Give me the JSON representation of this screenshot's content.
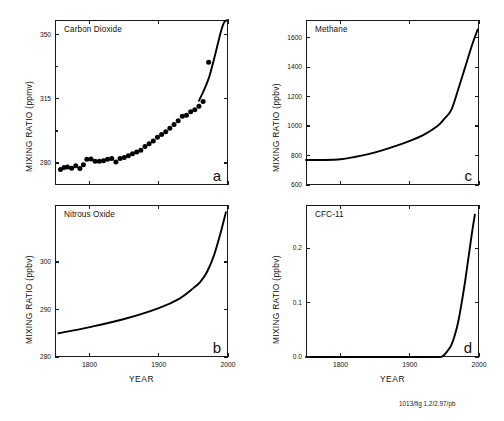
{
  "figure": {
    "credit": "1013/fig 1.2/2.97/pb",
    "xlabel": "YEAR"
  },
  "panels": [
    {
      "id": "a",
      "letter": "a",
      "title": "Carbon Dioxide",
      "ylabel": "MIXING RATIO (ppmv)",
      "ytick_labels": [
        "280",
        "315",
        "350"
      ],
      "xtick_labels": [
        "",
        "",
        ""
      ]
    },
    {
      "id": "c",
      "letter": "c",
      "title": "Methane",
      "ylabel": "MIXING RATIO (ppbv)",
      "ytick_labels": [
        "600",
        "800",
        "1000",
        "1200",
        "1400",
        "1600"
      ],
      "xtick_labels": [
        "",
        "",
        ""
      ]
    },
    {
      "id": "b",
      "letter": "b",
      "title": "Nitrous Oxide",
      "ylabel": "MIXING RATIO (ppbv)",
      "ytick_labels": [
        "280",
        "290",
        "300"
      ],
      "xtick_labels": [
        "1800",
        "1900",
        "2000"
      ]
    },
    {
      "id": "d",
      "letter": "d",
      "title": "CFC-11",
      "ylabel": "MIXING RATIO (ppbv)",
      "ytick_labels": [
        "0.0",
        "0.1",
        "0.2"
      ],
      "xtick_labels": [
        "1800",
        "1900",
        "2000"
      ]
    }
  ],
  "chart_data": [
    {
      "type": "scatter",
      "panel": "a",
      "title": "Carbon Dioxide",
      "xlabel": "YEAR",
      "ylabel": "MIXING RATIO (ppmv)",
      "units": "ppmv",
      "xlim": [
        1750,
        2000
      ],
      "ylim": [
        268,
        358
      ],
      "yticks": [
        280,
        315,
        350
      ],
      "xticks": [
        1800,
        1900,
        2000
      ],
      "grid": false,
      "legend": false,
      "series": [
        {
          "name": "CO2 ice-core measurements",
          "mode": "markers",
          "x": [
            1758,
            1763,
            1768,
            1774,
            1780,
            1786,
            1791,
            1796,
            1802,
            1808,
            1814,
            1820,
            1826,
            1832,
            1838,
            1844,
            1850,
            1856,
            1862,
            1868,
            1874,
            1880,
            1886,
            1892,
            1898,
            1904,
            1910,
            1916,
            1922,
            1928,
            1934,
            1940,
            1946,
            1952,
            1958,
            1964,
            1972
          ],
          "y": [
            276.5,
            277.5,
            277.8,
            277.2,
            278.5,
            277.0,
            279.0,
            282.0,
            282.2,
            281.0,
            281.0,
            281.2,
            282.0,
            282.5,
            280.5,
            282.5,
            283.0,
            284.0,
            285.0,
            286.0,
            287.0,
            289.0,
            290.5,
            292.0,
            294.0,
            295.5,
            297.0,
            299.0,
            301.0,
            303.0,
            305.5,
            306.0,
            308.0,
            309.0,
            311.0,
            313.5,
            335.0
          ]
        },
        {
          "name": "CO2 atmospheric record",
          "mode": "line",
          "x": [
            1958,
            1965,
            1972,
            1978,
            1984,
            1990,
            1995,
            2000
          ],
          "y": [
            314.0,
            319.5,
            326.0,
            334.0,
            343.0,
            352.0,
            357.0,
            358.0
          ]
        }
      ]
    },
    {
      "type": "line",
      "panel": "c",
      "title": "Methane",
      "xlabel": "YEAR",
      "ylabel": "MIXING RATIO (ppbv)",
      "units": "ppbv",
      "xlim": [
        1750,
        2000
      ],
      "ylim": [
        600,
        1720
      ],
      "yticks": [
        600,
        800,
        1000,
        1200,
        1400,
        1600
      ],
      "xticks": [
        1800,
        1900,
        2000
      ],
      "grid": false,
      "legend": false,
      "series": [
        {
          "name": "CH4",
          "mode": "line",
          "x": [
            1750,
            1775,
            1800,
            1820,
            1840,
            1860,
            1880,
            1900,
            1920,
            1940,
            1950,
            1960,
            1970,
            1980,
            1990,
            1998
          ],
          "y": [
            770,
            770,
            775,
            790,
            810,
            835,
            865,
            900,
            940,
            1000,
            1050,
            1110,
            1250,
            1400,
            1550,
            1655
          ]
        }
      ]
    },
    {
      "type": "line",
      "panel": "b",
      "title": "Nitrous Oxide",
      "xlabel": "YEAR",
      "ylabel": "MIXING RATIO (ppbv)",
      "units": "ppbv",
      "xlim": [
        1750,
        2000
      ],
      "ylim": [
        280,
        312
      ],
      "yticks": [
        280,
        290,
        300
      ],
      "xticks": [
        1800,
        1900,
        2000
      ],
      "grid": false,
      "legend": false,
      "series": [
        {
          "name": "N2O",
          "mode": "line",
          "x": [
            1755,
            1800,
            1850,
            1900,
            1930,
            1950,
            1960,
            1970,
            1980,
            1990,
            1997
          ],
          "y": [
            285.0,
            286.3,
            288.0,
            290.3,
            292.3,
            294.5,
            295.8,
            298.0,
            301.5,
            306.5,
            310.5
          ]
        }
      ]
    },
    {
      "type": "line",
      "panel": "d",
      "title": "CFC-11",
      "xlabel": "YEAR",
      "ylabel": "MIXING RATIO (ppbv)",
      "units": "ppbv",
      "xlim": [
        1750,
        2000
      ],
      "ylim": [
        0.0,
        0.28
      ],
      "yticks": [
        0.0,
        0.1,
        0.2
      ],
      "xticks": [
        1800,
        1900,
        2000
      ],
      "grid": false,
      "legend": false,
      "series": [
        {
          "name": "CFC-11",
          "mode": "line",
          "x": [
            1750,
            1900,
            1940,
            1948,
            1955,
            1960,
            1965,
            1970,
            1975,
            1980,
            1985,
            1990,
            1994
          ],
          "y": [
            0.0,
            0.0,
            0.0,
            0.002,
            0.012,
            0.022,
            0.04,
            0.065,
            0.1,
            0.14,
            0.185,
            0.23,
            0.262
          ]
        }
      ]
    }
  ]
}
